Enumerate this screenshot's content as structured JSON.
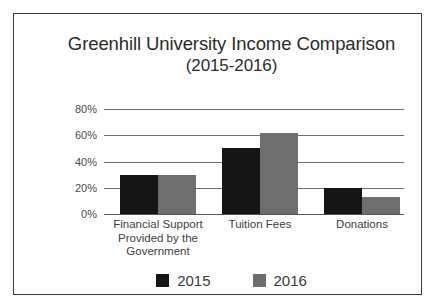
{
  "chart_data": {
    "type": "bar",
    "title": "Greenhill University Income Comparison (2015-2016)",
    "title_line1": "Greenhill University Income Comparison",
    "title_line2": "(2015-2016)",
    "xlabel": "",
    "ylabel": "",
    "ylim": [
      0,
      80
    ],
    "grid": true,
    "legend_position": "bottom",
    "ytick_labels": [
      "80%",
      "60%",
      "40%",
      "20%",
      "0%"
    ],
    "ytick_values": [
      80,
      60,
      40,
      20,
      0
    ],
    "categories": [
      "Financial Support Provided by the Government",
      "Tuition Fees",
      "Donations"
    ],
    "category_lines": [
      [
        "Financial Support",
        "Provided by the",
        "Government"
      ],
      [
        "Tuition Fees"
      ],
      [
        "Donations"
      ]
    ],
    "series": [
      {
        "name": "2015",
        "color": "#151515",
        "values": [
          30,
          50,
          20
        ]
      },
      {
        "name": "2016",
        "color": "#6e6e6e",
        "values": [
          30,
          62,
          13
        ]
      }
    ]
  },
  "legend": {
    "items": [
      {
        "label": "2015",
        "color": "#151515"
      },
      {
        "label": "2016",
        "color": "#6e6e6e"
      }
    ]
  }
}
